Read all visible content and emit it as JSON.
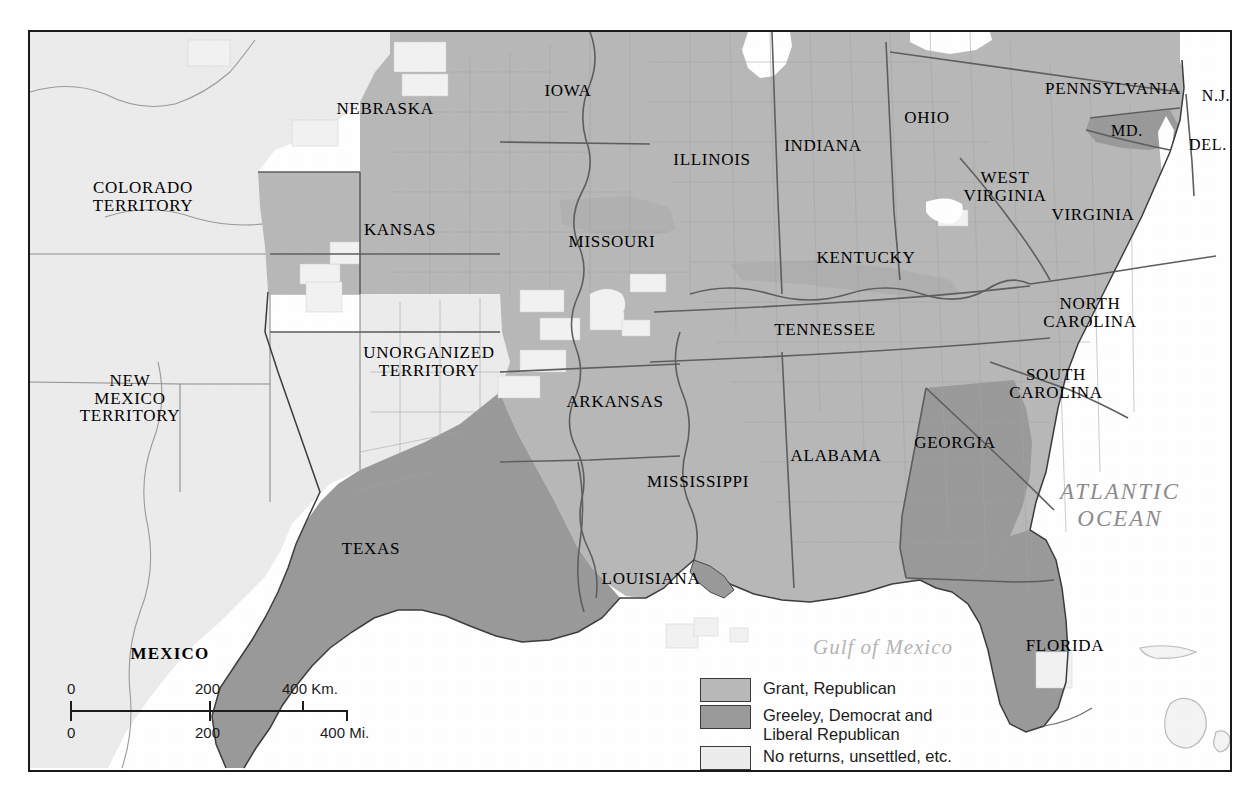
{
  "map": {
    "title": "Presidential Election of 1872",
    "frame": {
      "x": 28,
      "y": 30,
      "width": 1200,
      "height": 738
    }
  },
  "colors": {
    "grant_republican": "#b8b8b8",
    "greeley_democrat": "#9a9a9a",
    "no_returns": "#ececec",
    "water": "#ffffff",
    "unorganized_land": "#f0f0f0",
    "border": "#1a1a1a",
    "county_line": "#9c9c9c",
    "state_line": "#5a5a5a",
    "label_text": "#000000",
    "ocean_label": "#8c8c8c",
    "gulf_label": "#b4b4b4"
  },
  "legend": {
    "items": [
      {
        "label": "Grant, Republican",
        "color": "#b8b8b8",
        "category": "grant"
      },
      {
        "label": "Greeley, Democrat and\nLiberal Republican",
        "color": "#9a9a9a",
        "category": "greeley"
      },
      {
        "label": "No returns, unsettled, etc.",
        "color": "#ececec",
        "category": "no-returns"
      }
    ]
  },
  "scale": {
    "km": {
      "ticks": [
        "0",
        "200",
        "400 Km."
      ],
      "positions": [
        0,
        50,
        83.5
      ]
    },
    "mi": {
      "ticks": [
        "0",
        "200",
        "400 Mi."
      ],
      "positions": [
        0,
        50,
        100
      ]
    }
  },
  "state_labels": [
    {
      "name": "colorado-territory",
      "text": "COLORADO\nTERRITORY",
      "x": 113,
      "y": 165,
      "size": "s17",
      "bold": false
    },
    {
      "name": "new-mexico-territory",
      "text": "NEW\nMEXICO\nTERRITORY",
      "x": 100,
      "y": 367,
      "size": "s17",
      "bold": false
    },
    {
      "name": "unorganized-territory",
      "text": "UNORGANIZED\nTERRITORY",
      "x": 399,
      "y": 330,
      "size": "s17",
      "bold": false
    },
    {
      "name": "mexico",
      "text": "MEXICO",
      "x": 140,
      "y": 622,
      "size": "s17",
      "bold": true
    },
    {
      "name": "nebraska",
      "text": "NEBRASKA",
      "x": 355,
      "y": 77,
      "size": "s17",
      "bold": false
    },
    {
      "name": "kansas",
      "text": "KANSAS",
      "x": 370,
      "y": 198,
      "size": "s17",
      "bold": false
    },
    {
      "name": "iowa",
      "text": "IOWA",
      "x": 538,
      "y": 59,
      "size": "s17",
      "bold": false
    },
    {
      "name": "missouri",
      "text": "MISSOURI",
      "x": 582,
      "y": 210,
      "size": "s17",
      "bold": false
    },
    {
      "name": "illinois",
      "text": "ILLINOIS",
      "x": 682,
      "y": 128,
      "size": "s17",
      "bold": false
    },
    {
      "name": "indiana",
      "text": "INDIANA",
      "x": 793,
      "y": 114,
      "size": "s17",
      "bold": false
    },
    {
      "name": "ohio",
      "text": "OHIO",
      "x": 897,
      "y": 86,
      "size": "s17",
      "bold": false
    },
    {
      "name": "pennsylvania",
      "text": "PENNSYLVANIA",
      "x": 1083,
      "y": 57,
      "size": "s17",
      "bold": false
    },
    {
      "name": "new-jersey",
      "text": "N.J.",
      "x": 1186,
      "y": 64,
      "size": "s16",
      "bold": false
    },
    {
      "name": "maryland",
      "text": "MD.",
      "x": 1097,
      "y": 99,
      "size": "s16",
      "bold": false
    },
    {
      "name": "delaware",
      "text": "DEL.",
      "x": 1178,
      "y": 113,
      "size": "s16",
      "bold": false
    },
    {
      "name": "west-virginia",
      "text": "WEST\nVIRGINIA",
      "x": 975,
      "y": 155,
      "size": "s17",
      "bold": false
    },
    {
      "name": "virginia",
      "text": "VIRGINIA",
      "x": 1063,
      "y": 183,
      "size": "s17",
      "bold": false
    },
    {
      "name": "kentucky",
      "text": "KENTUCKY",
      "x": 836,
      "y": 226,
      "size": "s17",
      "bold": false
    },
    {
      "name": "tennessee",
      "text": "TENNESSEE",
      "x": 795,
      "y": 298,
      "size": "s17",
      "bold": false
    },
    {
      "name": "north-carolina",
      "text": "NORTH\nCAROLINA",
      "x": 1060,
      "y": 281,
      "size": "s17",
      "bold": false
    },
    {
      "name": "south-carolina",
      "text": "SOUTH\nCAROLINA",
      "x": 1026,
      "y": 352,
      "size": "s17",
      "bold": false
    },
    {
      "name": "arkansas",
      "text": "ARKANSAS",
      "x": 585,
      "y": 370,
      "size": "s17",
      "bold": false
    },
    {
      "name": "mississippi",
      "text": "MISSISSIPPI",
      "x": 668,
      "y": 450,
      "size": "s17",
      "bold": false
    },
    {
      "name": "alabama",
      "text": "ALABAMA",
      "x": 806,
      "y": 424,
      "size": "s17",
      "bold": false
    },
    {
      "name": "georgia",
      "text": "GEORGIA",
      "x": 925,
      "y": 411,
      "size": "s17",
      "bold": false
    },
    {
      "name": "louisiana",
      "text": "LOUISIANA",
      "x": 621,
      "y": 547,
      "size": "s17",
      "bold": false
    },
    {
      "name": "texas",
      "text": "TEXAS",
      "x": 341,
      "y": 517,
      "size": "s17",
      "bold": false
    },
    {
      "name": "florida",
      "text": "FLORIDA",
      "x": 1035,
      "y": 614,
      "size": "s17",
      "bold": false
    }
  ],
  "water_labels": [
    {
      "name": "atlantic-ocean",
      "text": "ATLANTIC\nOCEAN",
      "x": 1090,
      "y": 474,
      "style": "atlantic"
    },
    {
      "name": "gulf-of-mexico",
      "text": "Gulf of Mexico",
      "x": 853,
      "y": 615,
      "style": "gulf"
    }
  ],
  "election_results": {
    "grant_states": [
      "Iowa",
      "Illinois",
      "Indiana",
      "Ohio",
      "Pennsylvania",
      "New Jersey",
      "Maryland",
      "Delaware",
      "West Virginia",
      "Virginia",
      "Kentucky",
      "North Carolina",
      "South Carolina",
      "Alabama",
      "Mississippi",
      "Arkansas",
      "Louisiana",
      "Nebraska",
      "Kansas",
      "Missouri",
      "Tennessee"
    ],
    "greeley_states": [
      "Texas",
      "Georgia",
      "Florida",
      "Maryland",
      "Kentucky",
      "Tennessee",
      "Missouri"
    ],
    "unsettled": [
      "Colorado Territory",
      "New Mexico Territory",
      "Unorganized Territory"
    ]
  }
}
